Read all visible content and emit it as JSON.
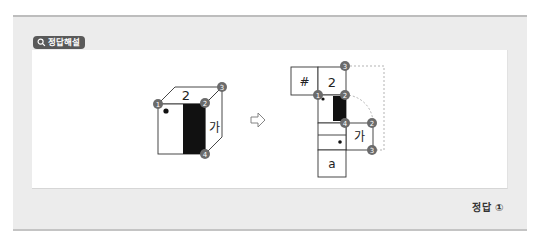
{
  "badge": {
    "icon": "search-icon",
    "label": "정답해설"
  },
  "cube": {
    "top_face_label": "2",
    "right_face_label": "가",
    "vertices": [
      {
        "id": "1",
        "label": "1"
      },
      {
        "id": "2",
        "label": "2"
      },
      {
        "id": "3",
        "label": "3"
      },
      {
        "id": "4",
        "label": "4"
      }
    ]
  },
  "arrow": {
    "icon": "right-arrow-outline-icon",
    "glyph": "⇨"
  },
  "net": {
    "faces": [
      "#",
      "2",
      "가",
      "a"
    ],
    "vertex_labels": {
      "top_right": "3",
      "mid_left": "1",
      "mid_right": "2",
      "lower_inner": "4",
      "ga_top_right": "2",
      "ga_bottom_right": "3"
    }
  },
  "answer": {
    "label": "정답",
    "value": "①",
    "text": "정답 ①"
  },
  "colors": {
    "badge_bg": "#595959",
    "panel_bg": "#ececec",
    "vertex_marker": "#6b6b6b",
    "black_face": "#111111"
  }
}
